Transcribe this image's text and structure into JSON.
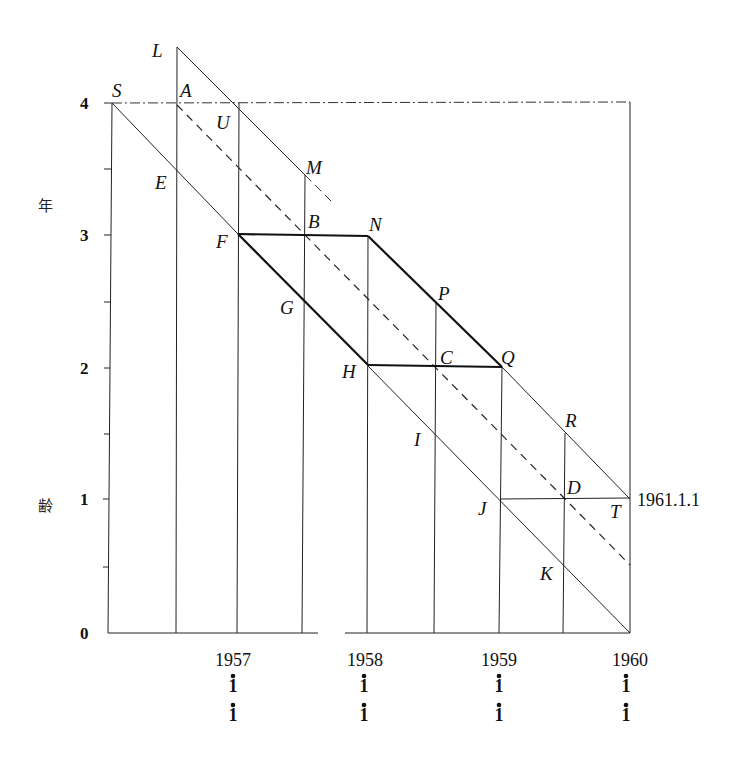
{
  "diagram": {
    "type": "Lexis diagram",
    "y_axis": {
      "title_chars": [
        "年",
        "齢"
      ],
      "ticks": [
        "0",
        "1",
        "2",
        "3",
        "4"
      ],
      "minor_tick_step": 0.5
    },
    "x_axis": {
      "ticks": [
        {
          "year": "1957",
          "sub1": "1",
          "sub2": "1"
        },
        {
          "year": "1958",
          "sub1": "1",
          "sub2": "1"
        },
        {
          "year": "1959",
          "sub1": "1",
          "sub2": "1"
        },
        {
          "year": "1960",
          "sub1": "1",
          "sub2": "1"
        }
      ]
    },
    "annotation_date": "1961.1.1",
    "points": {
      "S": "S",
      "L": "L",
      "A": "A",
      "U": "U",
      "E": "E",
      "M": "M",
      "F": "F",
      "B": "B",
      "N": "N",
      "G": "G",
      "P": "P",
      "H": "H",
      "C": "C",
      "Q": "Q",
      "I": "I",
      "R": "R",
      "J": "J",
      "D": "D",
      "T": "T",
      "K": "K"
    },
    "highlighted_region": [
      "F",
      "N",
      "Q",
      "H"
    ]
  }
}
